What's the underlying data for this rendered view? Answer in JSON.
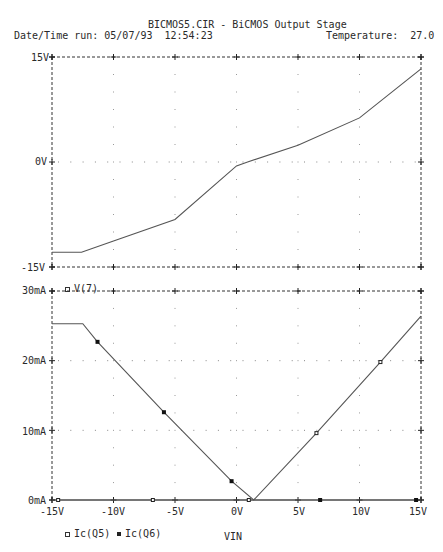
{
  "header": {
    "title": "BICMOS5.CIR - BiCMOS Output Stage",
    "datetime_label": "Date/Time run: 05/07/93  12:54:23",
    "temperature_label": "Temperature:  27.0"
  },
  "colors": {
    "trace": "#555555",
    "grid": "#333333",
    "background": "#ffffff"
  },
  "chart_data": [
    {
      "type": "line",
      "title": "BICMOS5.CIR - BiCMOS Output Stage",
      "xlabel": "VIN",
      "ylabel": "",
      "xlim": [
        -15,
        15
      ],
      "ylim": [
        -15,
        15
      ],
      "x_ticks": [
        -15,
        -10,
        -5,
        0,
        5,
        10,
        15
      ],
      "y_tick_labels": [
        "15V",
        "0V",
        "-15V"
      ],
      "y_ticks": [
        15,
        0,
        -15
      ],
      "grid": "dotted",
      "legend": [
        "V(7)"
      ],
      "series": [
        {
          "name": "V(7)",
          "marker": "open-square",
          "x": [
            -15,
            -12.6,
            -10,
            -5,
            0,
            0.9,
            5,
            10,
            15
          ],
          "y": [
            -12.9,
            -12.9,
            -11.3,
            -8.2,
            -0.55,
            0,
            2.4,
            6.3,
            13.3
          ]
        }
      ]
    },
    {
      "type": "line",
      "xlabel": "VIN",
      "ylabel": "",
      "xlim": [
        -15,
        15
      ],
      "ylim": [
        0,
        30
      ],
      "x_ticks": [
        -15,
        -10,
        -5,
        0,
        5,
        10,
        15
      ],
      "x_tick_labels": [
        "-15V",
        "-10V",
        "-5V",
        "0V",
        "5V",
        "10V",
        "15V"
      ],
      "y_ticks": [
        0,
        10,
        20,
        30
      ],
      "y_tick_labels": [
        "0mA",
        "10mA",
        "20mA",
        "30mA"
      ],
      "grid": "dotted",
      "legend": [
        "Ic(Q5)",
        "Ic(Q6)"
      ],
      "series": [
        {
          "name": "Ic(Q5)",
          "marker": "open-square",
          "x": [
            -15,
            1.4,
            6.5,
            11.7,
            15
          ],
          "y": [
            0,
            0,
            9.6,
            19.8,
            26.4
          ],
          "marker_points": [
            [
              -14.5,
              0
            ],
            [
              -6.8,
              0
            ],
            [
              1.0,
              0
            ],
            [
              6.5,
              9.6
            ],
            [
              11.7,
              19.8
            ]
          ]
        },
        {
          "name": "Ic(Q6)",
          "marker": "filled-square",
          "x": [
            -15,
            -12.5,
            -11.3,
            -5.9,
            -0.4,
            1.4,
            15
          ],
          "y": [
            25.3,
            25.3,
            22.7,
            12.6,
            2.7,
            0,
            0
          ],
          "marker_points": [
            [
              -11.3,
              22.7
            ],
            [
              -5.9,
              12.6
            ],
            [
              -0.4,
              2.7
            ],
            [
              6.8,
              0
            ],
            [
              14.6,
              0
            ]
          ]
        }
      ]
    }
  ],
  "axes": {
    "top": {
      "y_labels": [
        "15V",
        "0V",
        "-15V"
      ]
    },
    "bottom": {
      "y_labels": [
        "30mA",
        "20mA",
        "10mA",
        "0mA"
      ],
      "x_labels": [
        "-15V",
        "-10V",
        "-5V",
        "0V",
        "5V",
        "10V",
        "15V"
      ],
      "xlabel": "VIN"
    }
  },
  "legends": {
    "top": "V(7)",
    "bottom_q5": "Ic(Q5)",
    "bottom_q6": "Ic(Q6)"
  }
}
